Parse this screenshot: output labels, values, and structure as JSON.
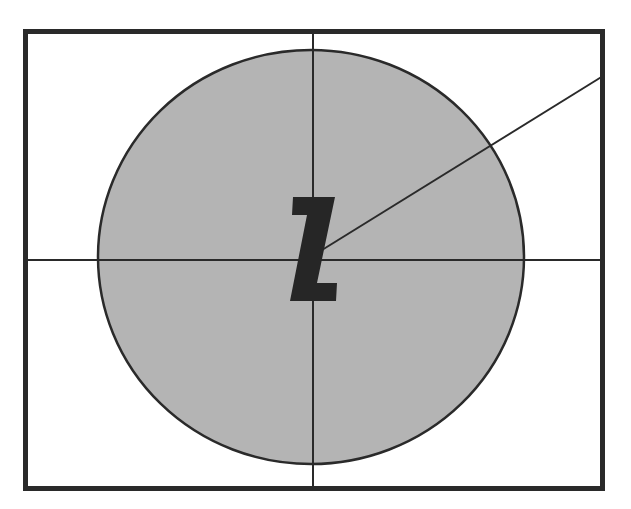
{
  "diagram": {
    "label": "Z",
    "colors": {
      "background": "#ffffff",
      "frame": "#2a2a2a",
      "circle_fill": "#b4b4b4",
      "circle_stroke": "#2a2a2a",
      "lines": "#2a2a2a",
      "label": "#262626"
    },
    "frame": {
      "x": 25,
      "y": 31,
      "width": 578,
      "height": 458
    },
    "circle": {
      "cx": 311,
      "cy": 257,
      "rx": 213,
      "ry": 207
    },
    "crosshair": {
      "vertical_x": 313,
      "horizontal_y": 260
    },
    "radius_line": {
      "x1": 322,
      "y1": 250,
      "x2": 603,
      "y2": 76
    }
  }
}
